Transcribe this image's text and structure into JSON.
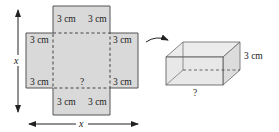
{
  "figure": {
    "net": {
      "top_flap_labels": [
        "3 cm",
        "3 cm"
      ],
      "left_flap_labels": [
        "3 cm",
        "3 cm"
      ],
      "right_flap_labels": [
        "3 cm",
        "3 cm"
      ],
      "bottom_flap_labels": [
        "3 cm",
        "3 cm"
      ],
      "base_length_label": "?",
      "side_label_vertical": "x",
      "side_label_horizontal": "x"
    },
    "box": {
      "height_label": "3 cm",
      "length_label": "?"
    },
    "colors": {
      "fill": "#d9d9d9",
      "stroke": "#555555",
      "dash": "#444444",
      "box_fill": "#e6e6e6"
    }
  }
}
